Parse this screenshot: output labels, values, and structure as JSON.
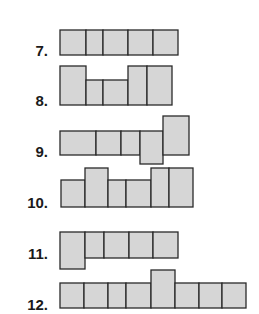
{
  "exercises": [
    {
      "number": "7.",
      "label_top": 43,
      "cells": [
        [
          60,
          30,
          26,
          25
        ],
        [
          86,
          30,
          17,
          25
        ],
        [
          103,
          30,
          25,
          25
        ],
        [
          128,
          30,
          25,
          25
        ],
        [
          153,
          30,
          25,
          25
        ]
      ]
    },
    {
      "number": "8.",
      "label_top": 93,
      "cells": [
        [
          60,
          66,
          26,
          39
        ],
        [
          86,
          80,
          17,
          25
        ],
        [
          103,
          80,
          25,
          25
        ],
        [
          128,
          66,
          19,
          39
        ],
        [
          147,
          66,
          25,
          39
        ]
      ]
    },
    {
      "number": "9.",
      "label_top": 144,
      "cells": [
        [
          60,
          131,
          36,
          24
        ],
        [
          96,
          131,
          25,
          24
        ],
        [
          121,
          131,
          19,
          24
        ],
        [
          140,
          131,
          23,
          33
        ],
        [
          163,
          116,
          26,
          39
        ]
      ]
    },
    {
      "number": "10.",
      "label_top": 195,
      "cells": [
        [
          61,
          180,
          24,
          27
        ],
        [
          85,
          168,
          23,
          39
        ],
        [
          108,
          180,
          18,
          27
        ],
        [
          126,
          180,
          25,
          27
        ],
        [
          151,
          168,
          18,
          39
        ],
        [
          169,
          168,
          24,
          39
        ]
      ]
    },
    {
      "number": "11.",
      "label_top": 246,
      "cells": [
        [
          60,
          232,
          25,
          37
        ],
        [
          85,
          232,
          19,
          26
        ],
        [
          104,
          232,
          25,
          26
        ],
        [
          129,
          232,
          24,
          26
        ],
        [
          153,
          232,
          25,
          26
        ]
      ]
    },
    {
      "number": "12.",
      "label_top": 297,
      "cells": [
        [
          60,
          283,
          24,
          25
        ],
        [
          84,
          283,
          24,
          25
        ],
        [
          108,
          283,
          18,
          25
        ],
        [
          126,
          283,
          25,
          25
        ],
        [
          151,
          270,
          24,
          38
        ],
        [
          175,
          283,
          24,
          25
        ],
        [
          199,
          283,
          23,
          25
        ],
        [
          222,
          283,
          24,
          25
        ]
      ]
    }
  ]
}
